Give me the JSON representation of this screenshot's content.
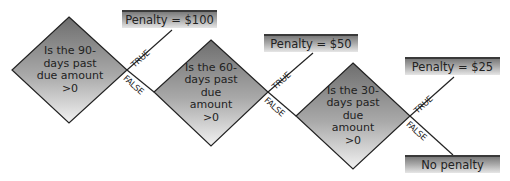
{
  "diagram": {
    "decisions": [
      {
        "id": "d1",
        "text": "Is the 90-days past due amount >0"
      },
      {
        "id": "d2",
        "text": "Is the 60-days past due amount >0"
      },
      {
        "id": "d3",
        "text": "Is the 30-days past due amount >0"
      }
    ],
    "outcomes": [
      {
        "id": "o1",
        "text": "Penalty = $100"
      },
      {
        "id": "o2",
        "text": "Penalty = $50"
      },
      {
        "id": "o3",
        "text": "Penalty = $25"
      },
      {
        "id": "o4",
        "text": "No penalty"
      }
    ],
    "edges": {
      "true_label": "TRUE",
      "false_label": "FALSE"
    }
  }
}
